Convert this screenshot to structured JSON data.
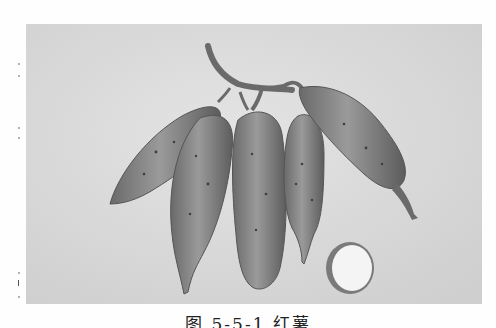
{
  "figure": {
    "caption": "图 5-5-1  红薯",
    "photo_colors": {
      "background": "#d9d9d9",
      "tuber_fill": "#8c8c8c",
      "tuber_shadow": "#5e5e5e",
      "cut_flesh": "#f4f4f4",
      "vine": "#6a6a6a"
    }
  }
}
